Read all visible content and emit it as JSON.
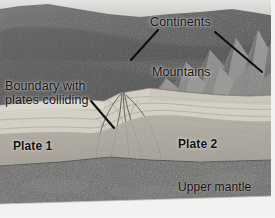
{
  "figure": {
    "type": "geological-cross-section-diagram"
  },
  "labels": {
    "continents": "Continents",
    "mountains": "Mountains",
    "boundary": "Boundary with\nplates colliding",
    "plate1": "Plate 1",
    "plate2": "Plate 2",
    "upper_mantle": "Upper mantle"
  },
  "leader_lines": [
    {
      "name": "continents-left-leader",
      "from": [
        158,
        30
      ],
      "to": [
        131,
        60
      ]
    },
    {
      "name": "continents-right-leader",
      "from": [
        215,
        32
      ],
      "to": [
        262,
        72
      ]
    },
    {
      "name": "boundary-leader",
      "from": [
        91,
        101
      ],
      "to": [
        114,
        128
      ]
    }
  ],
  "layers": [
    {
      "name": "sky-horizon",
      "color": "#d9d9d7"
    },
    {
      "name": "land-surface",
      "color": "#5e5e5e"
    },
    {
      "name": "mountains",
      "color": "#7b7b7b"
    },
    {
      "name": "upper-crust",
      "color": "#d7d3c8"
    },
    {
      "name": "lower-crust",
      "color": "#a9a49b"
    },
    {
      "name": "upper-mantle",
      "color": "#6b6a67"
    },
    {
      "name": "block-base",
      "color": "#f2f2f0"
    }
  ],
  "colors": {
    "label_text": "#111111",
    "leader_line": "#0d0d0d",
    "background": "#cfcfcf"
  }
}
